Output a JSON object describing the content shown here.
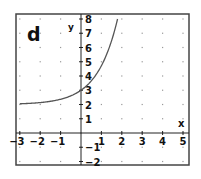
{
  "chart_data": {
    "type": "line",
    "panel_label": "d",
    "title": "",
    "xlabel": "x",
    "ylabel": "y",
    "xlim": [
      -3,
      5
    ],
    "ylim": [
      -2,
      8
    ],
    "x_ticks": [
      -3,
      -2,
      -1,
      1,
      2,
      3,
      4,
      5
    ],
    "y_ticks": [
      -2,
      -1,
      1,
      2,
      3,
      4,
      5,
      6,
      7,
      8
    ],
    "x_tick_labels": [
      "-3",
      "-2",
      "-1",
      "1",
      "2",
      "3",
      "4",
      "5"
    ],
    "y_tick_labels": [
      "-2",
      "-1",
      "1",
      "2",
      "3",
      "4",
      "5",
      "6",
      "7",
      "8"
    ],
    "grid": "dots at integer points",
    "series": [
      {
        "name": "y = 2 + e^x",
        "x": [
          -3,
          -2.5,
          -2,
          -1.5,
          -1,
          -0.5,
          0,
          0.25,
          0.5,
          0.75,
          1,
          1.25,
          1.5,
          1.6,
          1.7,
          1.79
        ],
        "values": [
          2.05,
          2.08,
          2.14,
          2.22,
          2.37,
          2.61,
          3.0,
          3.28,
          3.65,
          4.12,
          4.72,
          5.49,
          6.48,
          6.95,
          7.47,
          7.99
        ],
        "color": "#555555"
      }
    ],
    "horizontal_asymptote": 2,
    "y_intercept": 3
  },
  "colors": {
    "frame": "#444444",
    "axis": "#222222",
    "curve": "#555555",
    "grid_dot": "#9a9a9a",
    "text": "#111111"
  }
}
